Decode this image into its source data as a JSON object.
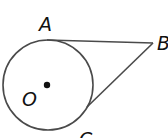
{
  "diagram": {
    "type": "geometry",
    "colors": {
      "stroke": "#4a4a4a",
      "label": "#111111",
      "background": "#ffffff"
    },
    "circle": {
      "center_label": "O",
      "cx": 48,
      "cy": 85,
      "r": 45
    },
    "points": [
      {
        "label": "A",
        "x": 47,
        "y": 40,
        "label_x": 39,
        "label_y": 31
      },
      {
        "label": "B",
        "x": 153,
        "y": 43,
        "label_x": 157,
        "label_y": 50
      },
      {
        "label": "C",
        "x": 87,
        "y": 107,
        "label_x": 79,
        "label_y": 146
      }
    ],
    "segments": [
      {
        "from": "A",
        "to": "B"
      },
      {
        "from": "C",
        "to": "B"
      }
    ],
    "labels": {
      "a": "A",
      "b": "B",
      "c": "C",
      "o": "O"
    }
  }
}
